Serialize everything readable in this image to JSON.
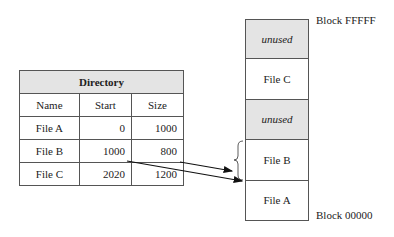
{
  "directory": {
    "title": "Directory",
    "columns": [
      "Name",
      "Start",
      "Size"
    ],
    "rows": [
      {
        "name": "File A",
        "start": "0",
        "size": "1000"
      },
      {
        "name": "File B",
        "start": "1000",
        "size": "800"
      },
      {
        "name": "File C",
        "start": "2020",
        "size": "1200"
      }
    ]
  },
  "storage": {
    "top_label": "Block FFFFF",
    "bottom_label": "Block 00000",
    "blocks": [
      {
        "label": "unused",
        "type": "unused"
      },
      {
        "label": "File C",
        "type": "file"
      },
      {
        "label": "unused",
        "type": "unused"
      },
      {
        "label": "File B",
        "type": "file"
      },
      {
        "label": "File A",
        "type": "file"
      }
    ]
  },
  "colors": {
    "unused_fill": "#e4e4e4",
    "header_fill": "#e4e4e4",
    "line": "#555555",
    "arrow": "#111111"
  }
}
